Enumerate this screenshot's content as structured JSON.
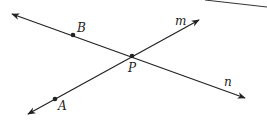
{
  "diagram": {
    "type": "geometry-intersecting-lines",
    "colors": {
      "line": "#222222",
      "background": "#ffffff",
      "edge": "#333333"
    },
    "lines": [
      {
        "name": "n",
        "label": "n",
        "passes_through": [
          "B",
          "P"
        ]
      },
      {
        "name": "m",
        "label": "m",
        "passes_through": [
          "A",
          "P"
        ]
      }
    ],
    "points": [
      {
        "name": "B",
        "label": "B"
      },
      {
        "name": "P",
        "label": "P"
      },
      {
        "name": "A",
        "label": "A"
      }
    ]
  }
}
